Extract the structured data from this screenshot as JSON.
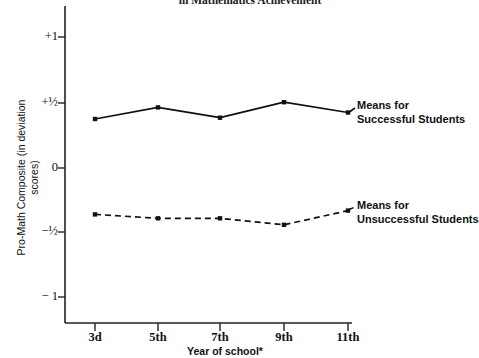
{
  "chart_data": {
    "type": "line",
    "title": "in Mathematics Achievement",
    "xlabel": "Year of school*",
    "ylabel_line1": "Pro-Math Composite",
    "ylabel_line2": "(in deviation scores)",
    "categories": [
      "3d",
      "5th",
      "7th",
      "9th",
      "11th"
    ],
    "yticks": [
      "+1",
      "+½",
      "0",
      "−½",
      "− 1"
    ],
    "ytick_values": [
      1,
      0.5,
      0,
      -0.5,
      -1
    ],
    "ylim": [
      -1.15,
      1.15
    ],
    "grid": false,
    "legend_position": "right-inline",
    "series": [
      {
        "name": "Means for Successful Students",
        "label_line1": "Means for",
        "label_line2": "Successful Students",
        "style": "solid",
        "color": "#111111",
        "marker": "square",
        "values": [
          0.38,
          0.47,
          0.39,
          0.51,
          0.43
        ]
      },
      {
        "name": "Means for Unsuccessful Students",
        "label_line1": "Means for",
        "label_line2": "Unsuccessful Students",
        "style": "dashed",
        "color": "#111111",
        "marker": "square",
        "values": [
          -0.36,
          -0.39,
          -0.39,
          -0.44,
          -0.33
        ]
      }
    ]
  },
  "colors": {
    "axis": "#222222",
    "ink": "#111111",
    "background": "#ffffff"
  }
}
